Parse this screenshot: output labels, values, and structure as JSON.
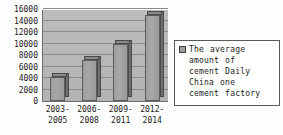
{
  "chart_data": {
    "type": "bar",
    "title": "",
    "xlabel": "",
    "ylabel": "",
    "categories": [
      "2003-2005",
      "2006-2008",
      "2009-2011",
      "2012-2014"
    ],
    "category_lines": [
      [
        "2003-",
        "2005"
      ],
      [
        "2006-",
        "2008"
      ],
      [
        "2009-",
        "2011"
      ],
      [
        "2012-",
        "2014"
      ]
    ],
    "values": [
      4200,
      7200,
      10000,
      15000
    ],
    "series": [
      {
        "name": "The average amount of cement Daily China one cement factory",
        "values": [
          4200,
          7200,
          10000,
          15000
        ]
      }
    ],
    "ylim": [
      0,
      16000
    ],
    "ytick_step": 2000,
    "yticks": [
      0,
      2000,
      4000,
      6000,
      8000,
      10000,
      12000,
      14000,
      16000
    ],
    "ytick_labels": [
      "0",
      "2000",
      "4000",
      "6000",
      "8000",
      "10000",
      "12000",
      "14000",
      "16000"
    ],
    "grid": true,
    "grid_axis": "y",
    "legend_position": "right",
    "legend": {
      "label": "The average amount of cement Daily China one cement factory",
      "lines": [
        "The average",
        "amount of",
        "cement Daily",
        "China one",
        "cement factory"
      ],
      "swatch_color": "#9d9d9d"
    },
    "colors": {
      "bar_fill": "#a3a3a3",
      "bar_side": "#6f6f6f",
      "bar_outline": "#5d5d5d",
      "plot_background": "#b9b9b9",
      "gridline": "#8c8c8c",
      "axis": "#6d6d6d",
      "text": "#1a1a1a",
      "page_background": "#ffffff"
    }
  }
}
